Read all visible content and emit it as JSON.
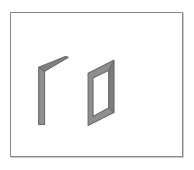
{
  "viewport": {
    "width": 194,
    "height": 170,
    "background_color": "#ffffff"
  },
  "frame": {
    "name": "image-frame",
    "x": 10,
    "y": 12,
    "width": 173,
    "height": 145,
    "border_color": "#8a8a8a",
    "border_width": 1,
    "fill_color": "#ffffff",
    "shadow_color": "#c9c9c9"
  },
  "scene": {
    "title": "",
    "description": "Two isometric gray panel shapes on a white background",
    "stroke_color": "#6b6b6b",
    "fill_light": "#9a9a9a",
    "fill_dark": "#777777",
    "shapes": [
      {
        "id": "left-angled-panel",
        "label": "left-angled-panel",
        "type": "angled-wall",
        "stroke": "#6b6b6b",
        "fill": "#8d8d8d",
        "outline_points": "40,68 40,125 46,126 46,72 68,59 65,57",
        "edge_points": "40,68 46,72"
      },
      {
        "id": "right-parallelogram-panel",
        "label": "right-parallelogram-panel",
        "type": "panel-frame",
        "stroke": "#6b6b6b",
        "fill": "#8d8d8d",
        "outer_points": "88,73 113,60 113,113 88,126",
        "inner_points": "93,77 108,69 108,108 93,118"
      }
    ]
  }
}
